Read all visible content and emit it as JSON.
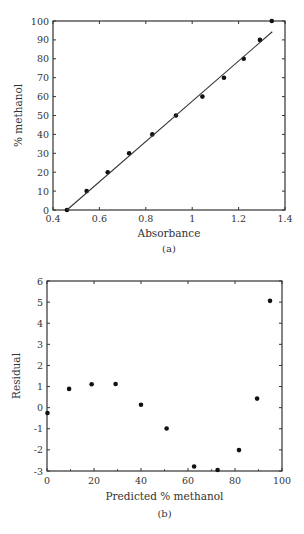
{
  "chart_data": [
    {
      "id": "a",
      "type": "scatter",
      "caption": "(a)",
      "title": "",
      "xlabel": "Absorbance",
      "ylabel": "% methanol",
      "xlim": [
        0.4,
        1.4
      ],
      "ylim": [
        0,
        100
      ],
      "xticks": [
        0.4,
        0.6,
        0.8,
        1,
        1.2,
        1.4
      ],
      "xtick_labels": [
        "0.4",
        "0.6",
        "0.8",
        "1",
        "1.2",
        "1.4"
      ],
      "yticks": [
        0,
        10,
        20,
        30,
        40,
        50,
        60,
        70,
        80,
        90,
        100
      ],
      "ytick_labels": [
        "0",
        "10",
        "20",
        "30",
        "40",
        "50",
        "60",
        "70",
        "80",
        "90",
        "100"
      ],
      "grid": false,
      "legend": null,
      "series": [
        {
          "name": "data",
          "mode": "markers",
          "x": [
            0.46,
            0.545,
            0.636,
            0.728,
            0.828,
            0.93,
            1.044,
            1.137,
            1.222,
            1.292,
            1.343
          ],
          "y": [
            0,
            10,
            20,
            30,
            40,
            50,
            60,
            70,
            80,
            90,
            100
          ]
        },
        {
          "name": "fit",
          "mode": "line",
          "x": [
            0.46,
            1.345
          ],
          "y": [
            0,
            94.3
          ]
        }
      ]
    },
    {
      "id": "b",
      "type": "scatter",
      "caption": "(b)",
      "title": "",
      "xlabel": "Predicted % methanol",
      "ylabel": "Residual",
      "xlim": [
        0,
        100
      ],
      "ylim": [
        -3,
        6
      ],
      "xticks": [
        0,
        20,
        40,
        60,
        80,
        100
      ],
      "xtick_labels": [
        "0",
        "20",
        "40",
        "60",
        "80",
        "100"
      ],
      "yticks": [
        -3,
        -2,
        -1,
        0,
        1,
        2,
        3,
        4,
        5,
        6
      ],
      "ytick_labels": [
        "-3",
        "-2",
        "-1",
        "0",
        "1",
        "2",
        "3",
        "4",
        "5",
        "6"
      ],
      "minor_xticks": [
        10,
        30,
        50,
        70,
        90
      ],
      "grid": false,
      "legend": null,
      "series": [
        {
          "name": "residuals",
          "mode": "markers",
          "x": [
            0.2,
            9.4,
            19.0,
            29.2,
            40.0,
            50.9,
            62.6,
            72.6,
            81.7,
            89.4,
            94.9
          ],
          "y": [
            -0.25,
            0.89,
            1.11,
            1.12,
            0.14,
            -0.99,
            -2.79,
            -2.95,
            -2.01,
            0.43,
            5.06
          ]
        }
      ]
    }
  ],
  "layout": {
    "panels": [
      {
        "left": 53,
        "top": 21,
        "right": 285,
        "bottom": 210,
        "xlabel_y": 237,
        "caption_y": 252,
        "ylabel_x": 22,
        "xtick_y": 222
      },
      {
        "left": 47,
        "top": 281,
        "right": 282,
        "bottom": 471,
        "xlabel_y": 500,
        "caption_y": 517,
        "ylabel_x": 20,
        "xtick_y": 484
      }
    ],
    "marker_color": "#111111",
    "axis_color": "#333333",
    "line_color": "#333333"
  }
}
